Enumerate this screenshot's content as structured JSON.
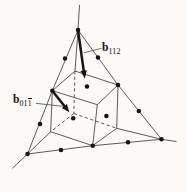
{
  "meta": {
    "figure_type": "crystallographic-diagram"
  },
  "palette": {
    "paper": "#fbfaf7",
    "thin_line": "#4a4a4a",
    "ink": "#141414"
  },
  "canvas": {
    "width": 186,
    "height": 192
  },
  "figure": {
    "line_width": 0.9,
    "arrow_width": 2.5,
    "dot_radius": 2.25,
    "tetrahedron_edges": [
      [
        78,
        30,
        52.3,
        90.7
      ],
      [
        52.3,
        90.7,
        27.5,
        154
      ],
      [
        78,
        30,
        118,
        85
      ],
      [
        118,
        85,
        161.5,
        139.3
      ],
      [
        27.5,
        154,
        92.7,
        145.7
      ],
      [
        92.7,
        145.7,
        161.5,
        139.3
      ]
    ],
    "axis_lines": [
      [
        79.5,
        5,
        78,
        30
      ],
      [
        78,
        30,
        75,
        71
      ],
      [
        12.3,
        168.3,
        27.5,
        154
      ],
      [
        27.5,
        154,
        50.7,
        131.7
      ],
      [
        176.5,
        141.5,
        161.5,
        139.3
      ],
      [
        161.5,
        139.3,
        116.7,
        128.3
      ]
    ],
    "cube_solid_edges": [
      [
        75,
        71,
        52.3,
        90.7
      ],
      [
        52.3,
        90.7,
        97.3,
        104.7
      ],
      [
        97.3,
        104.7,
        118,
        85
      ],
      [
        118,
        85,
        75,
        71
      ],
      [
        52.3,
        90.7,
        50.7,
        131.7
      ],
      [
        97.3,
        104.7,
        92.7,
        145.7
      ],
      [
        118,
        85,
        116.7,
        128.3
      ],
      [
        50.7,
        131.7,
        92.7,
        145.7
      ],
      [
        92.7,
        145.7,
        116.7,
        128.3
      ]
    ],
    "cube_dashed_edges": [
      [
        75,
        71,
        73.8,
        113.5
      ],
      [
        73.8,
        113.5,
        50.7,
        131.7
      ],
      [
        73.8,
        113.5,
        116.7,
        128.3
      ]
    ],
    "leader_lines": [
      [
        101.5,
        48.3,
        84,
        52.8
      ],
      [
        36,
        103.3,
        62.5,
        106.3
      ]
    ],
    "arrows": [
      {
        "name": "burgers-vector-b112",
        "from": [
          78,
          30
        ],
        "to": [
          84.8,
          78.5
        ]
      },
      {
        "name": "burgers-vector-b011bar",
        "from": [
          52.3,
          90.7
        ],
        "to": [
          69.3,
          112.3
        ]
      }
    ],
    "atom_dots": [
      [
        78,
        30
      ],
      [
        65,
        58.5
      ],
      [
        52.3,
        90.7
      ],
      [
        40,
        124
      ],
      [
        27.5,
        154
      ],
      [
        98,
        57.5
      ],
      [
        118,
        85
      ],
      [
        138.8,
        111
      ],
      [
        161.5,
        139.3
      ],
      [
        61,
        150
      ],
      [
        92.7,
        145.7
      ],
      [
        128,
        142.3
      ],
      [
        87,
        86.5
      ],
      [
        106.4,
        115.9
      ],
      [
        73.2,
        118.2
      ]
    ]
  },
  "labels": {
    "b112": {
      "symbol": "b",
      "sub": "112",
      "x": 102,
      "y": 41.5
    },
    "b011bar": {
      "symbol": "b",
      "sub_plain": "01",
      "sub_bar": "1",
      "x": 13,
      "y": 93.5
    }
  }
}
